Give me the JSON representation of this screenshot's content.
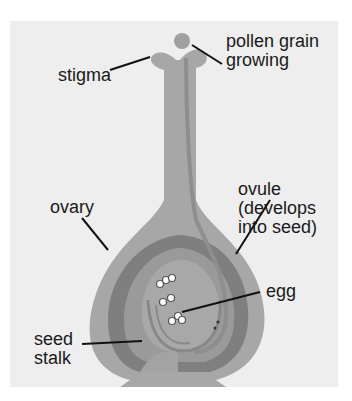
{
  "diagram": {
    "labels": {
      "pollen": "pollen grain\ngrowing",
      "stigma": "stigma",
      "ovary": "ovary",
      "ovule": "ovule\n(develops\ninto seed)",
      "egg": "egg",
      "seed_stalk": "seed\nstalk"
    },
    "colors": {
      "background": "#eeeeee",
      "outer_tissue": "#a7a7a7",
      "dark_layer": "#7f7f7f",
      "inner_tissue": "#a3a3a3",
      "pollen_tube": "#8e8e8e",
      "leader_line": "#111111"
    }
  }
}
